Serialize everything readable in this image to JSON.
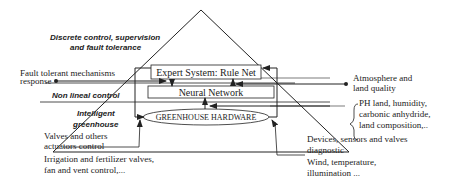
{
  "diagram": {
    "type": "layered-pyramid",
    "layers": [
      {
        "label_line1": "Discrete control, supervision",
        "label_line2": "and fault tolerance"
      },
      {
        "label": "Non lineal control"
      },
      {
        "label_line1": "Intelligent",
        "label_line2": "greenhouse"
      }
    ],
    "boxes": {
      "expert": "Expert System: Rule Net",
      "neural": "Neural Network",
      "hardware": "GREENHOUSE HARDWARE"
    },
    "left_annotations": {
      "fault_line1": "Fault tolerant mechanisms",
      "fault_line2": "response",
      "valves_line1": "Valves and others",
      "valves_line2": "actuators control",
      "irrigation_line1": "Irrigation and fertilizer valves,",
      "irrigation_line2": "fan and vent control,..."
    },
    "right_annotations": {
      "atmos_line1": "Atmosphere and",
      "atmos_line2": "land quality",
      "ph_line1": "PH land, humidity,",
      "ph_line2": "carbonic anhydride,",
      "ph_line3": "land composition,..",
      "devices_line1": "Devices, sensors and valves",
      "devices_line2": "diagnostic",
      "wind_line1": "Wind, temperature,",
      "wind_line2": "illumination ..."
    }
  }
}
